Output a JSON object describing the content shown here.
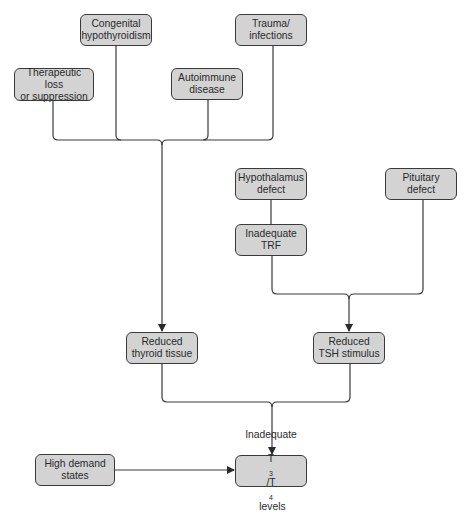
{
  "diagram": {
    "type": "flowchart",
    "colors": {
      "node_fill": "#d3d3d3",
      "node_border": "#3a3a3a",
      "line": "#3a3a3a",
      "background": "#ffffff"
    },
    "nodes": {
      "congenital": {
        "label": "Congenital\nhypothyroidism"
      },
      "trauma": {
        "label": "Trauma/\ninfections"
      },
      "therapeutic": {
        "label": "Therapeutic loss\nor suppression"
      },
      "autoimmune": {
        "label": "Autoimmune\ndisease"
      },
      "hypothalamus": {
        "label": "Hypothalamus\ndefect"
      },
      "pituitary": {
        "label": "Pituitary\ndefect"
      },
      "trf": {
        "label": "Inadequate\nTRF"
      },
      "reduced_thyroid": {
        "label": "Reduced\nthyroid tissue"
      },
      "reduced_tsh": {
        "label": "Reduced\nTSH stimulus"
      },
      "high_demand": {
        "label": "High demand\nstates"
      },
      "inadequate_t3t4": {
        "line1": "Inadequate",
        "t": "T",
        "sub3": "3",
        "slash": "/T",
        "sub4": "4",
        "rest": " levels"
      }
    },
    "edges": [
      {
        "from": [
          "therapeutic",
          "congenital",
          "autoimmune",
          "trauma"
        ],
        "to": "reduced_thyroid"
      },
      {
        "from": [
          "hypothalamus"
        ],
        "to": "trf"
      },
      {
        "from": [
          "trf",
          "pituitary"
        ],
        "to": "reduced_tsh"
      },
      {
        "from": [
          "reduced_thyroid",
          "reduced_tsh"
        ],
        "to": "inadequate_t3t4"
      },
      {
        "from": [
          "high_demand"
        ],
        "to": "inadequate_t3t4"
      }
    ]
  }
}
